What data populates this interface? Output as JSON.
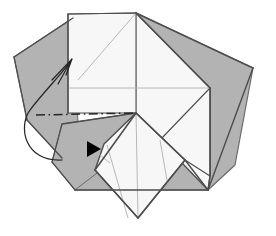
{
  "figure": {
    "title": "Origami folding step diagram",
    "type": "origami-instruction-diagram",
    "width": 276,
    "height": 236,
    "background_color": "#ffffff"
  },
  "colors": {
    "paper_front": "#f7f7f7",
    "paper_back_gray": "#b3b3b3",
    "paper_back_gray_dark": "#a6a6a6",
    "paper_mid_gray": "#c9c9c9",
    "edge_stroke": "#4d4d4d",
    "crease_stroke": "#b0b0b0",
    "fold_line_stroke": "#262626",
    "arrow_stroke": "#262626",
    "arrowhead_fill": "#000000"
  },
  "shapes": [
    {
      "name": "back-layer-left-gray",
      "role": "underlying-paper-back-left",
      "fill": "#b3b3b3",
      "points": "14,57 73,18 78,124 62,158 27,120"
    },
    {
      "name": "back-layer-right-gray",
      "role": "underlying-paper-back-right",
      "fill": "#b3b3b3",
      "points": "136,13 253,68 235,165 208,190 160,140 167,60"
    },
    {
      "name": "lower-left-gray-flap",
      "role": "folded-back-flap-lower-left",
      "fill": "#b3b3b3",
      "points": "62,124 136,113 110,163 75,190 52,162"
    },
    {
      "name": "lower-gray-band",
      "role": "folded-back-band-bottom",
      "fill": "#b3b3b3",
      "points": "62,158 75,190 208,190 185,160 136,113"
    },
    {
      "name": "right-white-panel",
      "role": "paper-front-right-panel",
      "fill": "#f7f7f7",
      "points": "136,13 210,88 210,176 208,190 160,140 136,113"
    },
    {
      "name": "main-white-rectangle",
      "role": "paper-front-main-panel",
      "fill": "#f7f7f7",
      "points": "68,14 136,13 136,113 68,113"
    },
    {
      "name": "bottom-white-flap",
      "role": "paper-front-bottom-flap",
      "fill": "#f7f7f7",
      "points": "136,113 185,160 138,218 95,170 104,144"
    },
    {
      "name": "right-white-wedge",
      "role": "paper-front-right-wedge",
      "fill": "#f7f7f7",
      "points": "210,88 210,176 185,160 160,140"
    }
  ],
  "edges": [
    {
      "name": "edge-rect-top",
      "points": "68,14 136,13",
      "width": 1.2
    },
    {
      "name": "edge-rect-left",
      "points": "68,14 68,113",
      "width": 1.2
    },
    {
      "name": "edge-apex-to-right-gray",
      "points": "136,13 253,68",
      "width": 1.4
    },
    {
      "name": "edge-right-gray-lower",
      "points": "253,68 208,190",
      "width": 1.4
    },
    {
      "name": "edge-apex-to-right-panel",
      "points": "136,13 210,88",
      "width": 1.4
    },
    {
      "name": "edge-right-panel-vertical",
      "points": "210,88 210,176",
      "width": 1.4
    },
    {
      "name": "edge-right-panel-to-bottom-vertex",
      "points": "210,176 208,190",
      "width": 1.4
    },
    {
      "name": "edge-bottom-gray-baseline",
      "points": "75,190 208,190",
      "width": 1.4
    },
    {
      "name": "edge-center-to-lower-right",
      "points": "136,113 185,160",
      "width": 1.6
    },
    {
      "name": "edge-lower-right-to-bottom-vertex",
      "points": "185,160 208,190",
      "width": 1.4
    },
    {
      "name": "edge-center-to-lower-left",
      "points": "136,113 95,170",
      "width": 1.6
    },
    {
      "name": "edge-bottom-flap-left",
      "points": "95,170 138,218",
      "width": 1.4
    },
    {
      "name": "edge-bottom-flap-right",
      "points": "138,218 185,160",
      "width": 1.4
    },
    {
      "name": "edge-left-gray-upper",
      "points": "14,57 73,18",
      "width": 1.3
    },
    {
      "name": "edge-left-gray-left",
      "points": "14,57 27,120",
      "width": 1.3
    },
    {
      "name": "edge-left-gray-lower",
      "points": "27,120 62,158",
      "width": 1.3
    },
    {
      "name": "edge-gray-flap-left",
      "points": "62,124 52,162",
      "width": 1.2
    },
    {
      "name": "edge-gray-flap-lower",
      "points": "52,162 75,190",
      "width": 1.2
    },
    {
      "name": "edge-center-to-gray-flap",
      "points": "136,113 62,124",
      "width": 1.3
    }
  ],
  "creases": [
    {
      "name": "crease-diagonal-apex-to-left",
      "points": "136,13 78,80"
    },
    {
      "name": "crease-horizontal-mid",
      "points": "68,88 210,88"
    },
    {
      "name": "crease-rect-vertical-center",
      "points": "136,13 136,113"
    },
    {
      "name": "crease-flap-left-radial",
      "points": "107,145 128,218"
    },
    {
      "name": "crease-flap-center-radial",
      "points": "136,113 138,218"
    },
    {
      "name": "crease-flap-right-radial",
      "points": "160,140 168,186"
    },
    {
      "name": "crease-gray-flap-inner",
      "points": "62,124 110,163"
    }
  ],
  "fold_line": {
    "name": "mountain-fold-line",
    "style": "dash-dot",
    "points": "36,115 136,113",
    "dash_pattern": "9,3.5,1.6,3.5",
    "stroke": "#262626",
    "width": 1.5
  },
  "arrows": [
    {
      "name": "fold-motion-arrow",
      "role": "fold-direction-curved-arrow",
      "path": "M 62,160 C 24,162 18,126 30,110 C 42,94 58,78 70,62",
      "head": {
        "name": "arrow-open-head",
        "style": "open-v",
        "tip": "72,59",
        "barbs": "M 52,80 L 72,59 M 58,84 L 72,59 M 66,75 L 72,59"
      }
    }
  ],
  "markers": [
    {
      "name": "fold-here-triangle-marker",
      "role": "solid-triangle-direction-indicator",
      "points": "87,141 101,149 87,157",
      "fill": "#000000"
    }
  ]
}
